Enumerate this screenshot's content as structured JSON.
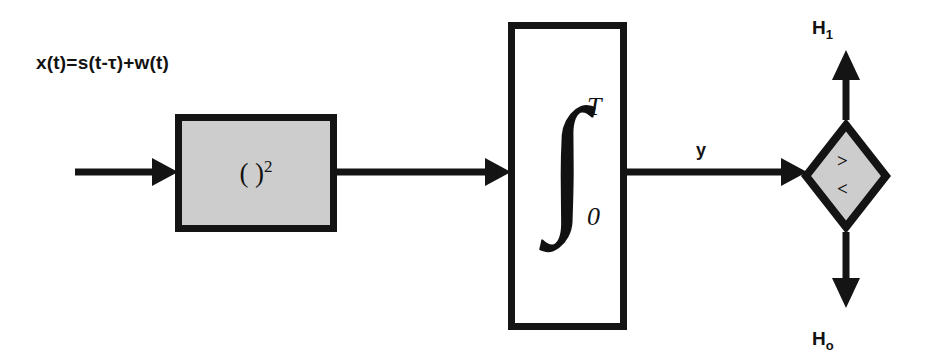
{
  "diagram": {
    "colors": {
      "stroke": "#141414",
      "block_fill": "#cdcdcd",
      "integrator_fill": "#ffffff",
      "background": "#ffffff",
      "text": "#121212"
    },
    "input": {
      "equation": "x(t)=s(t-τ)+w(t)"
    },
    "squarer": {
      "label_open": "( )",
      "label_exponent": "2"
    },
    "integrator": {
      "symbol": "∫",
      "upper_limit": "T",
      "lower_limit": "0"
    },
    "decision": {
      "greater_than": ">",
      "less_than": "<"
    },
    "signals": {
      "y_label": "y",
      "h1_label": "H",
      "h1_subscript": "1",
      "h0_label": "H",
      "h0_subscript": "o"
    }
  }
}
